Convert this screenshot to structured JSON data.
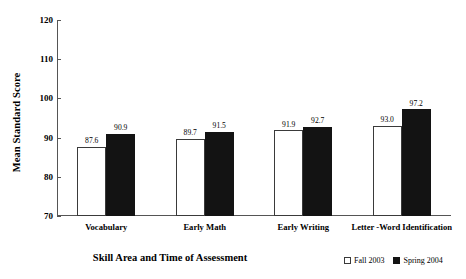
{
  "chart_data": {
    "type": "bar",
    "title": "",
    "xlabel": "Skill Area and Time of Assessment",
    "ylabel": "Mean Standard Score",
    "categories": [
      "Vocabulary",
      "Early Math",
      "Early Writing",
      "Letter -Word Identification"
    ],
    "series": [
      {
        "name": "Fall 2003",
        "color": "#ffffff",
        "values": [
          87.6,
          89.7,
          91.9,
          93.0
        ]
      },
      {
        "name": "Spring 2004",
        "color": "#131313",
        "values": [
          90.9,
          91.5,
          92.7,
          97.2
        ]
      }
    ],
    "value_labels": [
      [
        "87.6",
        "90.9"
      ],
      [
        "89.7",
        "91.5"
      ],
      [
        "91.9",
        "92.7"
      ],
      [
        "93.0",
        "97.2"
      ]
    ],
    "ylim": [
      70,
      120
    ],
    "yticks": [
      70,
      80,
      90,
      100,
      110,
      120
    ],
    "ytick_labels": [
      "70",
      "80",
      "90",
      "100",
      "110",
      "120"
    ],
    "grid": false,
    "legend_position": "bottom-right"
  },
  "legend": {
    "items": [
      {
        "label": "Fall 2003",
        "swatch": "open-square"
      },
      {
        "label": "Spring 2004",
        "swatch": "filled-square"
      }
    ]
  }
}
